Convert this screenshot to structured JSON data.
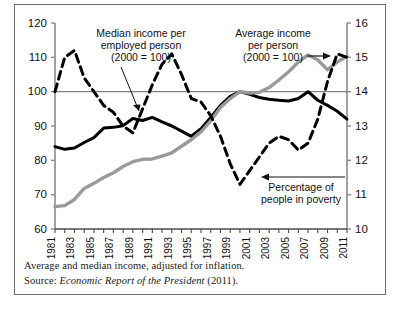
{
  "figure": {
    "background": "#ffffff",
    "border_color": "#6e6e6e"
  },
  "footnote": {
    "line1": "Average and median income, adjusted for inflation.",
    "source_prefix": "Source: ",
    "source_title": "Economic Report of the President",
    "source_year": " (2011)."
  },
  "annotations": {
    "median": {
      "line1": "Median income per",
      "line2": "employed person",
      "line3": "(2000 = 100)"
    },
    "average": {
      "line1": "Average income",
      "line2": "per person",
      "line3": "(2000 = 100)"
    },
    "poverty": {
      "line1": "Percentage of",
      "line2": "people in poverty"
    }
  },
  "chart_data": {
    "type": "line",
    "title": "",
    "xlabel": "",
    "ylabel": "",
    "grid": false,
    "legend_position": "inline-annotations",
    "x": [
      1981,
      1982,
      1983,
      1984,
      1985,
      1986,
      1987,
      1988,
      1989,
      1990,
      1991,
      1992,
      1993,
      1994,
      1995,
      1996,
      1997,
      1998,
      1999,
      2000,
      2001,
      2002,
      2003,
      2004,
      2005,
      2006,
      2007,
      2008,
      2009,
      2010,
      2011
    ],
    "xtick_labels": [
      "1981",
      "1983",
      "1985",
      "1987",
      "1989",
      "1991",
      "1993",
      "1995",
      "1997",
      "1999",
      "2001",
      "2003",
      "2005",
      "2007",
      "2009",
      "2011"
    ],
    "xlim": [
      1981,
      2011
    ],
    "left_axis": {
      "label": "Index (2000 = 100)",
      "ylim": [
        60,
        120
      ],
      "ticks": [
        60,
        70,
        80,
        90,
        100,
        110,
        120
      ]
    },
    "right_axis": {
      "label": "Percent",
      "ylim": [
        10,
        16
      ],
      "ticks": [
        10,
        11,
        12,
        13,
        14,
        15,
        16
      ]
    },
    "reference_line": {
      "left_value": 100,
      "right_value": 14,
      "color": "#808080"
    },
    "series": [
      {
        "name": "Median income per employed person (2000 = 100)",
        "axis": "left",
        "style": "solid",
        "color": "#000000",
        "width": 3,
        "values": [
          84.0,
          83.2,
          83.6,
          85.2,
          86.6,
          89.4,
          89.6,
          90.1,
          92.2,
          91.6,
          92.5,
          91.2,
          90.0,
          88.5,
          87.0,
          89.2,
          92.5,
          96.0,
          98.6,
          100.0,
          99.2,
          98.3,
          97.8,
          97.5,
          97.3,
          98.0,
          100.0,
          97.5,
          96.0,
          94.3,
          92.0
        ]
      },
      {
        "name": "Average income per person (2000 = 100)",
        "axis": "left",
        "style": "solid",
        "color": "#9a9a9a",
        "width": 3.4,
        "values": [
          66.5,
          66.8,
          68.6,
          71.8,
          73.3,
          75.0,
          76.4,
          78.2,
          79.6,
          80.3,
          80.4,
          81.2,
          82.2,
          84.1,
          86.0,
          88.3,
          91.5,
          95.4,
          98.0,
          100.0,
          99.6,
          99.8,
          101.2,
          103.4,
          105.8,
          108.6,
          110.7,
          109.2,
          106.4,
          108.6,
          110.4
        ]
      },
      {
        "name": "Percentage of people in poverty",
        "axis": "right",
        "style": "dashed",
        "color": "#000000",
        "width": 3,
        "values": [
          14.0,
          15.0,
          15.2,
          14.4,
          14.0,
          13.6,
          13.4,
          13.0,
          12.8,
          13.5,
          14.2,
          14.8,
          15.1,
          14.5,
          13.8,
          13.7,
          13.3,
          12.7,
          11.9,
          11.3,
          11.7,
          12.1,
          12.5,
          12.7,
          12.6,
          12.3,
          12.5,
          13.2,
          14.3,
          15.1,
          15.0
        ]
      }
    ]
  }
}
